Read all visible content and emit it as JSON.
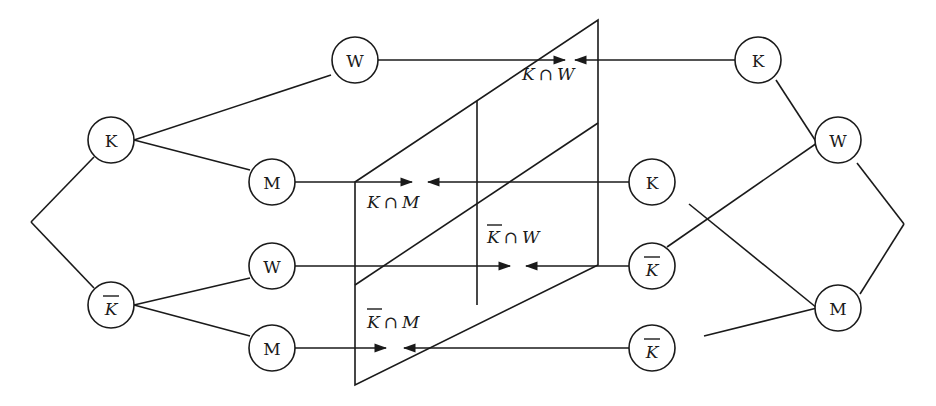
{
  "diagram": {
    "background": "#ffffff",
    "stroke_color": "#1a1a1a",
    "left_tree": {
      "root_children": [
        {
          "id": "L-K",
          "label": "K",
          "overline": false,
          "children": [
            {
              "id": "L-K-W",
              "label": "W",
              "overline": false
            },
            {
              "id": "L-K-M",
              "label": "M",
              "overline": false
            }
          ]
        },
        {
          "id": "L-Kbar",
          "label": "K",
          "overline": true,
          "children": [
            {
              "id": "L-Kbar-W",
              "label": "W",
              "overline": false
            },
            {
              "id": "L-Kbar-M",
              "label": "M",
              "overline": false
            }
          ]
        }
      ]
    },
    "right_tree": {
      "root_children": [
        {
          "id": "R-W",
          "label": "W",
          "overline": false,
          "children": [
            {
              "id": "R-W-K",
              "label": "K",
              "overline": false
            },
            {
              "id": "R-W-Kbar",
              "label": "K",
              "overline": true
            }
          ]
        },
        {
          "id": "R-M",
          "label": "M",
          "overline": false,
          "children": [
            {
              "id": "R-M-K",
              "label": "K",
              "overline": false
            },
            {
              "id": "R-M-Kbar",
              "label": "K",
              "overline": true
            }
          ]
        }
      ]
    },
    "intersections": [
      {
        "id": "K-and-W",
        "left": "K",
        "left_overline": false,
        "op": "∩",
        "right": "W"
      },
      {
        "id": "K-and-M",
        "left": "K",
        "left_overline": false,
        "op": "∩",
        "right": "M"
      },
      {
        "id": "Kbar-and-W",
        "left": "K",
        "left_overline": true,
        "op": "∩",
        "right": "W"
      },
      {
        "id": "Kbar-and-M",
        "left": "K",
        "left_overline": true,
        "op": "∩",
        "right": "M"
      }
    ]
  }
}
